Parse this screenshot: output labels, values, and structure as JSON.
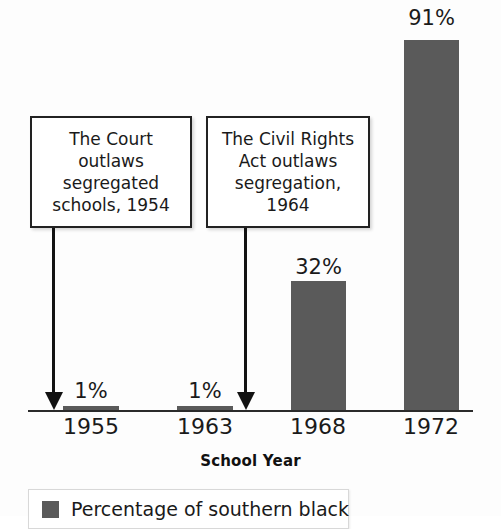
{
  "chart_data": {
    "type": "bar",
    "title": "",
    "xlabel": "School Year",
    "ylabel": "",
    "categories": [
      "1955",
      "1963",
      "1968",
      "1972"
    ],
    "values": [
      1,
      1,
      32,
      91
    ],
    "value_labels": [
      "1%",
      "1%",
      "32%",
      "91%"
    ],
    "ylim": [
      0,
      100
    ],
    "grid": false,
    "legend_position": "bottom-left",
    "series": [
      {
        "name": "Percentage of southern black",
        "color": "#5a5a5a",
        "values": [
          1,
          1,
          32,
          91
        ]
      }
    ],
    "annotations": [
      {
        "text": "The Court\noutlaws\nsegregated\nschools, 1954",
        "points_to": "1955",
        "year": 1954
      },
      {
        "text": "The Civil Rights\nAct outlaws\nsegregation,\n1964",
        "points_to": "1963",
        "year": 1964
      }
    ]
  },
  "axis": {
    "x_title": "School Year",
    "ticks": [
      {
        "label": "1955",
        "center": 91
      },
      {
        "label": "1963",
        "center": 205
      },
      {
        "label": "1968",
        "center": 318
      },
      {
        "label": "1972",
        "center": 431
      }
    ]
  },
  "bars": [
    {
      "label": "1%",
      "year": "1955",
      "value": 1,
      "left": 63,
      "width": 56,
      "height": 4,
      "label_left": 63,
      "label_top": 379
    },
    {
      "label": "1%",
      "year": "1963",
      "value": 1,
      "left": 177,
      "width": 56,
      "height": 4,
      "label_left": 177,
      "label_top": 379
    },
    {
      "label": "32%",
      "year": "1968",
      "value": 32,
      "left": 291,
      "width": 55,
      "height": 129,
      "label_left": 291,
      "label_top": 255
    },
    {
      "label": "91%",
      "year": "1972",
      "value": 91,
      "left": 404,
      "width": 55,
      "height": 370,
      "label_left": 404,
      "label_top": 6
    }
  ],
  "callouts": [
    {
      "id": "court-callout",
      "text": "The Court\noutlaws\nsegregated\nschools, 1954",
      "left": 30,
      "top": 116,
      "width": 162,
      "height": 112,
      "arrow_x": 52,
      "arrow_top": 228,
      "arrow_height": 164
    },
    {
      "id": "civil-rights-callout",
      "text": "The Civil Rights\nAct outlaws\nsegregation,\n1964",
      "left": 206,
      "top": 116,
      "width": 164,
      "height": 112,
      "arrow_x": 244,
      "arrow_top": 228,
      "arrow_height": 164
    }
  ],
  "legend": {
    "swatch_color": "#5a5a5a",
    "label": "Percentage of southern black"
  },
  "colors": {
    "bar": "#5a5a5a",
    "axis": "#2b2b2b",
    "text": "#1a1a1a",
    "callout_border": "#222222",
    "background": "#fdfdfd"
  }
}
